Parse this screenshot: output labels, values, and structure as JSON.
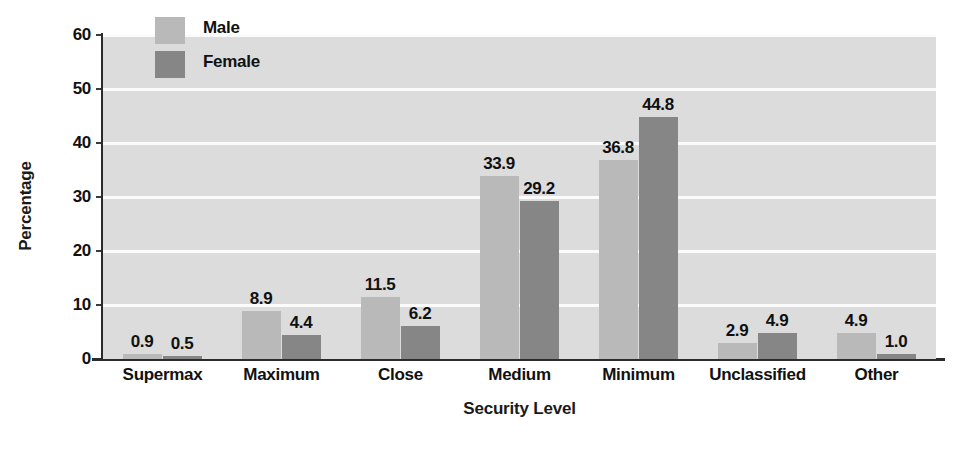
{
  "chart_data": {
    "type": "bar",
    "title": "",
    "xlabel": "Security Level",
    "ylabel": "Percentage",
    "categories": [
      "Supermax",
      "Maximum",
      "Close",
      "Medium",
      "Minimum",
      "Unclassified",
      "Other"
    ],
    "series": [
      {
        "name": "Male",
        "color": "#b9b9b9",
        "values": [
          0.9,
          8.9,
          11.5,
          33.9,
          36.8,
          2.9,
          4.9
        ]
      },
      {
        "name": "Female",
        "color": "#868686",
        "values": [
          0.5,
          4.4,
          6.2,
          29.2,
          44.8,
          4.9,
          1.0
        ]
      }
    ],
    "value_labels": [
      [
        "0.9",
        "0.5"
      ],
      [
        "8.9",
        "4.4"
      ],
      [
        "11.5",
        "6.2"
      ],
      [
        "33.9",
        "29.2"
      ],
      [
        "36.8",
        "44.8"
      ],
      [
        "2.9",
        "4.9"
      ],
      [
        "4.9",
        "1.0"
      ]
    ],
    "ylim": [
      0,
      60
    ],
    "yticks": [
      0,
      10,
      20,
      30,
      40,
      50,
      60
    ],
    "ytick_labels": [
      "0",
      "10",
      "20",
      "30",
      "40",
      "50",
      "60"
    ],
    "grid": true,
    "grid_color": "#fbfbfb",
    "plot_background": "#dcdcdc",
    "legend_position": "top-left-inside",
    "legend_entries": [
      "Male",
      "Female"
    ]
  }
}
